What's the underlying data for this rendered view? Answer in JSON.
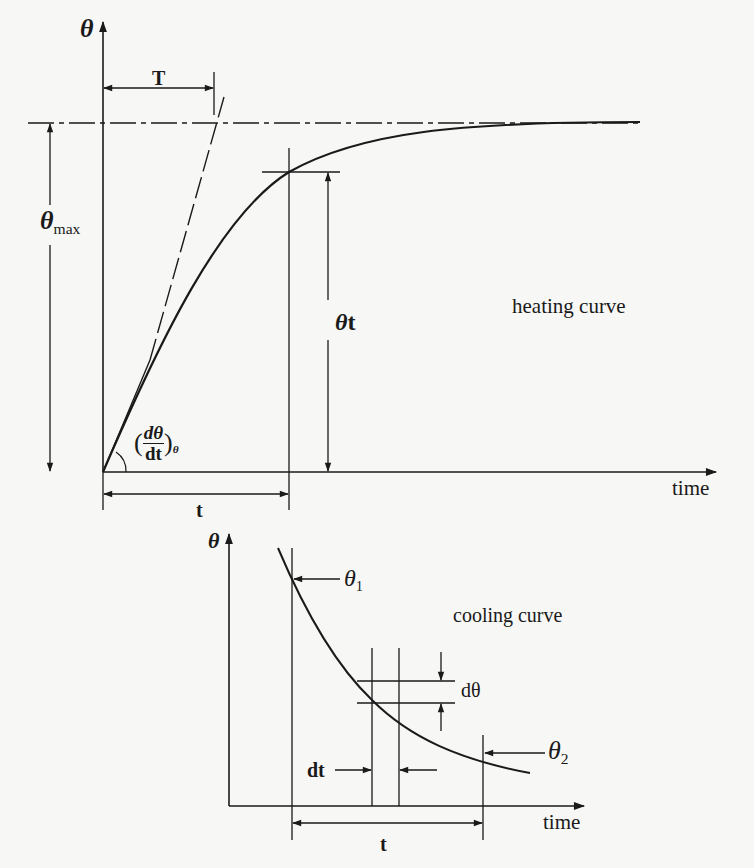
{
  "figure": {
    "heating": {
      "y_axis_label": "θ",
      "x_axis_label": "time",
      "time_constant_label": "T",
      "theta_max_label": "θ",
      "theta_max_sub": "max",
      "theta_t_label": "θ",
      "theta_t_sub": "t",
      "slope_num": "dθ",
      "slope_den": "dt",
      "slope_sub": "θ",
      "slope_open": "(",
      "slope_close": ")",
      "interval_label": "t",
      "curve_label": "heating curve"
    },
    "cooling": {
      "y_axis_label": "θ",
      "x_axis_label": "time",
      "theta1_label": "θ",
      "theta1_sub": "1",
      "theta2_label": "θ",
      "theta2_sub": "2",
      "dtheta_label": "dθ",
      "dt_label": "dt",
      "interval_label": "t",
      "curve_label": "cooling curve"
    }
  },
  "colors": {
    "background": "#f7f7f5",
    "ink": "#1a1a1a"
  }
}
